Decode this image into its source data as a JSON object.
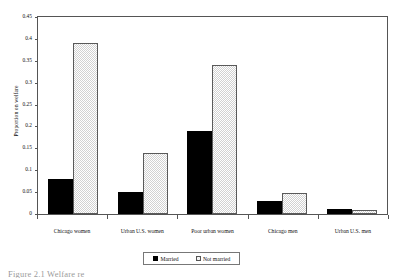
{
  "chart_data": {
    "type": "bar",
    "title": "",
    "xlabel": "",
    "ylabel": "Proportion on welfare",
    "ylim": [
      0,
      0.45
    ],
    "ytick_step": 0.05,
    "grid": false,
    "legend_position": "bottom",
    "categories": [
      "Chicago women",
      "Urban U.S. women",
      "Poor urban women",
      "Chicago men",
      "Urban U.S. men"
    ],
    "ytick_labels": [
      "0",
      "0.05",
      "0.1",
      "0.15",
      "0.2",
      "0.25",
      "0.3",
      "0.35",
      "0.4",
      "0.45"
    ],
    "series": [
      {
        "name": "Married",
        "fill": "solid-black",
        "color": "#000000",
        "values": [
          0.08,
          0.05,
          0.19,
          0.03,
          0.012
        ]
      },
      {
        "name": "Not married",
        "fill": "checkered-gray",
        "color": "#d2d2d2",
        "values": [
          0.39,
          0.14,
          0.34,
          0.049,
          0.01
        ]
      }
    ]
  },
  "legend": {
    "entries": [
      {
        "label": "Married"
      },
      {
        "label": "Not married"
      }
    ]
  },
  "caption": {
    "text": "Figure 2.1   Welfare re"
  }
}
